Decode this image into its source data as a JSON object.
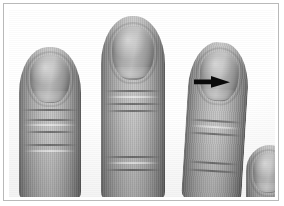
{
  "figure": {
    "domain": "medical-photograph",
    "caption": "",
    "title": "",
    "frame": {
      "border_color": "#b9b9b9",
      "background_color": "#ffffff"
    },
    "photo": {
      "color_mode": "grayscale",
      "background_color": "#ffffff",
      "subject": "fingertips"
    },
    "annotations": [
      {
        "name": "arrow",
        "shape": "solid-arrow",
        "direction": "right",
        "color": "#000000",
        "points_at": "finger-3-nail",
        "label": ""
      }
    ],
    "fingers": [
      {
        "id": "finger-1",
        "label": "index finger",
        "position": "left",
        "nail_label": "nail"
      },
      {
        "id": "finger-2",
        "label": "middle finger",
        "position": "center",
        "nail_label": "nail"
      },
      {
        "id": "finger-3",
        "label": "ring finger",
        "position": "right",
        "nail_label": "nail",
        "annotated": "true"
      },
      {
        "id": "finger-4",
        "label": "little finger",
        "position": "far-right-lower",
        "nail_label": "nail"
      }
    ],
    "colors": {
      "skin_midtone": "#a8a8a8",
      "skin_highlight": "#c4c4c4",
      "skin_shadow": "#5f5f5f",
      "nail_midtone": "#adadad",
      "arrow": "#000000",
      "frame_border": "#b9b9b9",
      "background": "#ffffff"
    }
  }
}
